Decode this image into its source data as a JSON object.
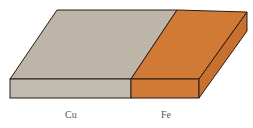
{
  "diagram": {
    "segments": [
      {
        "label": "Cu",
        "top_color": "#bdb5a8",
        "front_color": "#c2bbb0"
      },
      {
        "label": "Fe",
        "top_color": "#d17a36",
        "front_color": "#d27b38",
        "side_color": "#c8702f"
      }
    ],
    "outline_color": "#2a1a14"
  }
}
